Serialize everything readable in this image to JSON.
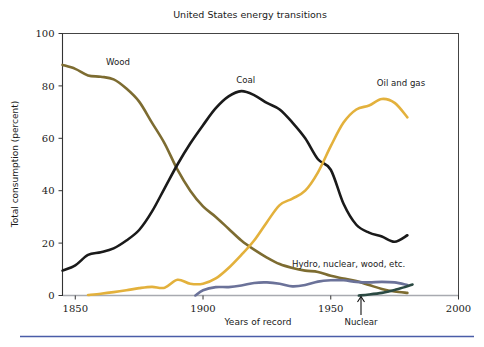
{
  "chart_data": {
    "type": "line",
    "title": "United States energy transitions",
    "xlabel": "Years of record",
    "ylabel": "Total consumption (percent)",
    "xlim": [
      1845,
      2000
    ],
    "ylim": [
      0,
      100
    ],
    "xticks": [
      1850,
      1900,
      1950,
      2000
    ],
    "xtick_labels": [
      "1850",
      "1900",
      "1950",
      "2000"
    ],
    "yticks": [
      0,
      20,
      40,
      60,
      80,
      100
    ],
    "ytick_labels": [
      "0",
      "20",
      "40",
      "60",
      "80",
      "100"
    ],
    "grid": false,
    "legend_position": "inline-labels",
    "series": [
      {
        "name": "Wood",
        "color": "#7d6c31",
        "label_x": 1862,
        "label_y": 88,
        "x": [
          1845,
          1850,
          1855,
          1860,
          1865,
          1870,
          1875,
          1880,
          1885,
          1890,
          1895,
          1900,
          1905,
          1910,
          1915,
          1920,
          1925,
          1930,
          1935,
          1940,
          1945,
          1950,
          1955,
          1960,
          1965,
          1970,
          1975,
          1980
        ],
        "y": [
          88,
          86.5,
          84,
          83.5,
          82.5,
          79,
          74,
          66,
          58,
          48,
          40,
          34,
          30,
          25.5,
          21,
          17.5,
          14.5,
          12,
          10.5,
          9.5,
          9.0,
          7.5,
          6.5,
          5.5,
          4.0,
          2.5,
          1.5,
          1.0
        ]
      },
      {
        "name": "Coal",
        "color": "#1a1a1a",
        "label_x": 1913,
        "label_y": 81,
        "x": [
          1845,
          1850,
          1855,
          1860,
          1865,
          1870,
          1875,
          1880,
          1885,
          1890,
          1895,
          1900,
          1905,
          1910,
          1915,
          1920,
          1925,
          1930,
          1935,
          1940,
          1945,
          1950,
          1955,
          1960,
          1965,
          1970,
          1975,
          1980
        ],
        "y": [
          9.5,
          11.5,
          15.5,
          16.5,
          18,
          21,
          25,
          32,
          41,
          50,
          58,
          65,
          71.5,
          76,
          78,
          76.5,
          73.5,
          71,
          66,
          60,
          52,
          48,
          35,
          27,
          24,
          22.5,
          20.5,
          23
        ]
      },
      {
        "name": "Oil and gas",
        "color": "#e3b13c",
        "label_x": 1968,
        "label_y": 80,
        "x": [
          1855,
          1860,
          1865,
          1870,
          1875,
          1880,
          1885,
          1890,
          1895,
          1900,
          1905,
          1910,
          1915,
          1920,
          1925,
          1930,
          1935,
          1940,
          1945,
          1950,
          1955,
          1960,
          1965,
          1970,
          1975,
          1980
        ],
        "y": [
          0.2,
          0.7,
          1.3,
          2.0,
          2.8,
          3.3,
          3.0,
          6.0,
          4.5,
          4.5,
          6.5,
          10.5,
          15.5,
          21,
          28,
          34.5,
          37,
          40,
          47,
          57,
          66,
          71,
          72.5,
          75,
          73.5,
          68
        ]
      },
      {
        "name": "Hydro, nuclear, wood, etc.",
        "color": "#6b7299",
        "label_x": 1957,
        "label_y": 11,
        "x": [
          1897,
          1900,
          1905,
          1910,
          1915,
          1920,
          1925,
          1930,
          1935,
          1940,
          1945,
          1950,
          1955,
          1960,
          1965,
          1970,
          1975,
          1980
        ],
        "y": [
          0,
          2.0,
          3.2,
          3.2,
          3.8,
          4.8,
          5.0,
          4.5,
          3.5,
          4.0,
          5.3,
          5.8,
          5.8,
          5.2,
          5.0,
          5.2,
          5.0,
          4.0
        ]
      },
      {
        "name": "Nuclear",
        "color": "#2b4a43",
        "label_x": 1962,
        "label_y": -9,
        "x": [
          1961,
          1965,
          1970,
          1973,
          1976,
          1979,
          1982
        ],
        "y": [
          0,
          0.4,
          1.0,
          1.6,
          2.4,
          3.2,
          4.2
        ]
      }
    ],
    "annotations": [
      {
        "text": "Nuclear",
        "kind": "arrow-up",
        "x": 1962
      }
    ],
    "colors": {
      "wood": "#7d6c31",
      "coal": "#1a1a1a",
      "oil_and_gas": "#e3b13c",
      "hydro_nuclear": "#6b7299",
      "nuclear": "#2b4a43",
      "frame": "#444444",
      "baseline": "#a8aab0",
      "rule": "#4a5da8",
      "background": "#ffffff"
    }
  },
  "footer": {
    "rule_color": "#4a5da8"
  }
}
